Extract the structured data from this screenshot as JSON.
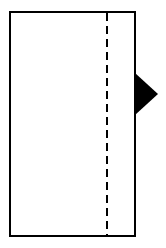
{
  "diagram": {
    "rectangle": {
      "x": 10,
      "y": 12,
      "width": 125,
      "height": 224,
      "stroke": "#000000",
      "stroke_width": 2
    },
    "fold_line": {
      "x": 107,
      "y1": 12,
      "y2": 236,
      "style": "dashed",
      "dash": "8,5",
      "stroke": "#000000"
    },
    "arrow_marker": {
      "points": "135,73 158,94 135,115",
      "fill": "#000000",
      "direction": "right"
    }
  }
}
